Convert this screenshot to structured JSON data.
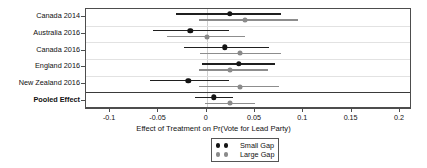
{
  "chart_data": {
    "type": "scatter",
    "subtype": "forest-plot",
    "title": "",
    "xlabel": "Effect of Treatment on Pr(Vote for Lead Party)",
    "ylabel": "",
    "xlim": [
      -0.125,
      0.2125
    ],
    "xticks": [
      -0.1,
      -0.05,
      0,
      0.05,
      0.1,
      0.15,
      0.2
    ],
    "xticklabels": [
      "-0.1",
      "-0.05",
      "0",
      "0.05",
      "0.1",
      "0.15",
      "0.2"
    ],
    "grid": false,
    "row_separators": true,
    "zero_reference_line": 0,
    "legend_position": "bottom-center",
    "categories": [
      "Canada 2014",
      "Australia 2016",
      "Canada 2016",
      "England 2016",
      "New Zealand 2016",
      "Pooled Effect"
    ],
    "series": [
      {
        "name": "Small Gap",
        "color": "#141414",
        "estimates": [
          0.024,
          -0.017,
          0.019,
          0.033,
          -0.019,
          0.007
        ],
        "ci_low": [
          -0.032,
          -0.056,
          -0.024,
          -0.005,
          -0.059,
          -0.012
        ],
        "ci_high": [
          0.077,
          0.023,
          0.064,
          0.071,
          0.023,
          0.027
        ]
      },
      {
        "name": "Large Gap",
        "color": "#8a8a8a",
        "estimates": [
          0.04,
          0.0,
          0.034,
          0.024,
          0.034,
          0.024
        ],
        "ci_low": [
          -0.008,
          -0.041,
          -0.007,
          -0.008,
          -0.008,
          -0.002
        ],
        "ci_high": [
          0.095,
          0.04,
          0.077,
          0.063,
          0.075,
          0.05
        ]
      }
    ]
  },
  "axis": {
    "x_title": "Effect of Treatment on Pr(Vote for Lead Party)",
    "tick_labels": [
      "-0.1",
      "-0.05",
      "0",
      "0.05",
      "0.1",
      "0.15",
      "0.2"
    ]
  },
  "rows": [
    {
      "label": "Canada 2014",
      "bold": false
    },
    {
      "label": "Australia 2016",
      "bold": false
    },
    {
      "label": "Canada 2016",
      "bold": false
    },
    {
      "label": "England 2016",
      "bold": false
    },
    {
      "label": "New Zealand 2016",
      "bold": false
    },
    {
      "label": "Pooled Effect",
      "bold": true
    }
  ],
  "legend": {
    "entries": [
      {
        "label": "Small Gap",
        "color": "#141414"
      },
      {
        "label": "Large Gap",
        "color": "#8a8a8a"
      }
    ]
  }
}
